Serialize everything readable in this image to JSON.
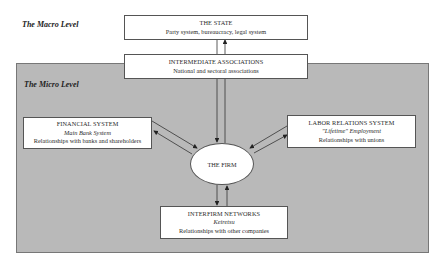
{
  "levels": {
    "macro": "The Macro Level",
    "micro": "The Micro Level"
  },
  "nodes": {
    "state": {
      "title": "THE STATE",
      "subtitle": "Party system, bureaucracy, legal system"
    },
    "intermediate": {
      "title": "INTERMEDIATE ASSOCIATIONS",
      "subtitle": "National and sectoral associations"
    },
    "financial": {
      "title": "FINANCIAL SYSTEM",
      "italic": "Main Bank System",
      "detail": "Relationships with banks and shareholders"
    },
    "labor": {
      "title": "LABOR RELATIONS SYSTEM",
      "italic": "\"Lifetime\" Employment",
      "detail": "Relationships with unions"
    },
    "interfirm": {
      "title": "INTERFIRM NETWORKS",
      "italic": "Keiretsu",
      "detail": "Relationships with other companies"
    },
    "firm": {
      "title": "THE FIRM"
    }
  },
  "edges": [
    {
      "from": "state",
      "to": "firm",
      "direction": "bidirectional"
    },
    {
      "from": "financial",
      "to": "firm",
      "direction": "bidirectional"
    },
    {
      "from": "labor",
      "to": "firm",
      "direction": "bidirectional"
    },
    {
      "from": "interfirm",
      "to": "firm",
      "direction": "bidirectional"
    }
  ]
}
